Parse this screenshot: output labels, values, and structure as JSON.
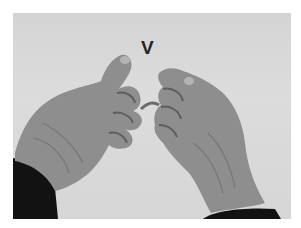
{
  "image": {
    "description": "Grayscale photo of two hands forming a sign-language handshape",
    "label": "V",
    "colors": {
      "background": "#d8d8d8",
      "skin": "#8c8c8c",
      "skin_shadow": "#6a6a6a",
      "sleeve": "#121212",
      "label": "#262626"
    }
  }
}
